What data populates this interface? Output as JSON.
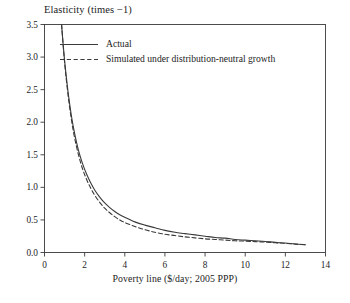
{
  "chart_data": {
    "type": "line",
    "title": "Elasticity (times −1)",
    "xlabel": "Poverty line ($/day; 2005 PPP)",
    "ylabel": "Elasticity (times −1)",
    "xlim": [
      0,
      14
    ],
    "ylim": [
      0.0,
      3.5
    ],
    "xticks": [
      0,
      2,
      4,
      6,
      8,
      10,
      12,
      14
    ],
    "xtick_labels": [
      "0",
      "2",
      "4",
      "6",
      "8",
      "10",
      "12",
      "14"
    ],
    "yticks": [
      0.0,
      0.5,
      1.0,
      1.5,
      2.0,
      2.5,
      3.0,
      3.5
    ],
    "ytick_labels": [
      "0.0",
      "0.5",
      "1.0",
      "1.5",
      "2.0",
      "2.5",
      "3.0",
      "3.5"
    ],
    "grid": false,
    "legend_position": "top-left-inside",
    "line_color": "#3a3a3a",
    "series": [
      {
        "name": "Actual",
        "style": "solid",
        "x": [
          0.85,
          0.95,
          1.05,
          1.2,
          1.35,
          1.5,
          1.7,
          1.9,
          2.1,
          2.3,
          2.5,
          2.75,
          3.0,
          3.25,
          3.5,
          3.75,
          4.0,
          4.5,
          5.0,
          5.5,
          6.0,
          6.5,
          7.0,
          7.5,
          8.0,
          8.5,
          9.0,
          9.5,
          10.0,
          10.5,
          11.0,
          11.5,
          12.0,
          12.5,
          13.0
        ],
        "values": [
          3.5,
          3.12,
          2.8,
          2.4,
          2.08,
          1.83,
          1.56,
          1.36,
          1.2,
          1.07,
          0.96,
          0.85,
          0.76,
          0.69,
          0.63,
          0.58,
          0.54,
          0.47,
          0.42,
          0.38,
          0.34,
          0.31,
          0.29,
          0.27,
          0.25,
          0.23,
          0.22,
          0.2,
          0.19,
          0.18,
          0.17,
          0.155,
          0.145,
          0.13,
          0.12
        ]
      },
      {
        "name": "Simulated under distribution-neutral growth",
        "style": "dashed",
        "x": [
          0.85,
          0.95,
          1.05,
          1.2,
          1.35,
          1.5,
          1.7,
          1.9,
          2.1,
          2.3,
          2.5,
          2.75,
          3.0,
          3.25,
          3.5,
          3.75,
          4.0,
          4.5,
          5.0,
          5.5,
          6.0,
          6.5,
          7.0,
          7.5,
          8.0,
          8.5,
          9.0,
          9.5,
          10.0,
          10.5,
          11.0,
          11.5,
          12.0,
          12.5,
          13.0
        ],
        "values": [
          3.5,
          3.1,
          2.76,
          2.35,
          2.02,
          1.76,
          1.49,
          1.28,
          1.12,
          0.99,
          0.88,
          0.77,
          0.68,
          0.61,
          0.55,
          0.5,
          0.46,
          0.4,
          0.35,
          0.31,
          0.28,
          0.26,
          0.24,
          0.225,
          0.21,
          0.2,
          0.19,
          0.18,
          0.175,
          0.167,
          0.16,
          0.15,
          0.14,
          0.128,
          0.118
        ]
      }
    ]
  },
  "legend": {
    "items": [
      {
        "label": "Actual",
        "style": "solid"
      },
      {
        "label": "Simulated under distribution-neutral growth",
        "style": "dashed"
      }
    ]
  }
}
